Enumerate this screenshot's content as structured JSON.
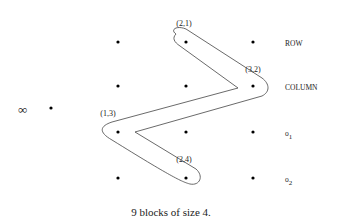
{
  "diagram": {
    "grid": {
      "columns": 3,
      "rows": 4
    },
    "infinity_symbol": "∞",
    "row_labels": [
      "ROW",
      "COLUMN",
      "o1",
      "o2"
    ],
    "row_label_parts": [
      {
        "main": "ROW",
        "sub": ""
      },
      {
        "main": "COLUMN",
        "sub": ""
      },
      {
        "main": "o",
        "sub": "1"
      },
      {
        "main": "o",
        "sub": "2"
      }
    ],
    "path_points": [
      {
        "label": "(2,1)",
        "col": 2,
        "row": 1
      },
      {
        "label": "(3,2)",
        "col": 3,
        "row": 2
      },
      {
        "label": "(1,3)",
        "col": 1,
        "row": 3
      },
      {
        "label": "(2,4)",
        "col": 2,
        "row": 4
      }
    ],
    "caption": "9 blocks of size 4."
  }
}
